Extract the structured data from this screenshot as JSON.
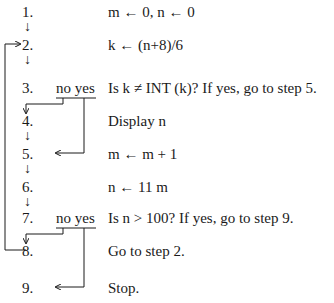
{
  "diagram": {
    "type": "algorithm-flowchart",
    "steps": [
      {
        "num": "1.",
        "text": "m ← 0, n ← 0"
      },
      {
        "num": "2.",
        "text": "k ← (n+8)/6"
      },
      {
        "num": "3.",
        "text": "Is k ≠ INT (k)? If yes, go to step 5.",
        "branch": "no yes"
      },
      {
        "num": "4.",
        "text": "Display n"
      },
      {
        "num": "5.",
        "text": "m ← m + 1"
      },
      {
        "num": "6.",
        "text": "n ← 11 m"
      },
      {
        "num": "7.",
        "text": "Is n > 100? If yes, go to step 9.",
        "branch": "no yes"
      },
      {
        "num": "8.",
        "text": "Go to step 2."
      },
      {
        "num": "9.",
        "text": "Stop."
      }
    ],
    "connections": [
      {
        "from": "1",
        "to": "2",
        "kind": "sequential"
      },
      {
        "from": "2",
        "to": "3",
        "kind": "sequential"
      },
      {
        "from": "3",
        "to": "4",
        "kind": "no-branch"
      },
      {
        "from": "3",
        "to": "5",
        "kind": "yes-branch"
      },
      {
        "from": "4",
        "to": "5",
        "kind": "sequential"
      },
      {
        "from": "5",
        "to": "6",
        "kind": "sequential"
      },
      {
        "from": "6",
        "to": "7",
        "kind": "sequential"
      },
      {
        "from": "7",
        "to": "8",
        "kind": "no-branch"
      },
      {
        "from": "7",
        "to": "9",
        "kind": "yes-branch"
      },
      {
        "from": "8",
        "to": "2",
        "kind": "loop-back"
      }
    ],
    "line_color": "#1a1a1a"
  }
}
